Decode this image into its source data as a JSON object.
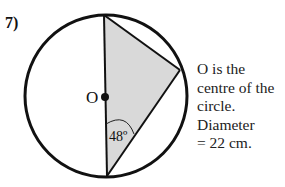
{
  "question": {
    "number": "7)"
  },
  "diagram": {
    "center_label": "O",
    "angle_label": "48º",
    "angle_value_deg": 48,
    "colors": {
      "stroke": "#111111",
      "shade": "#d9d9d9",
      "background": "#ffffff"
    }
  },
  "note": {
    "lines": [
      "O is the",
      "centre of the",
      "circle.",
      "Diameter",
      "= 22 cm."
    ]
  }
}
